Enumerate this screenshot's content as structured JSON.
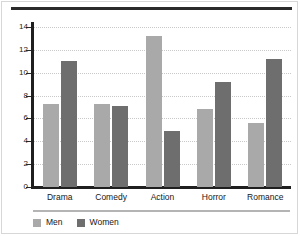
{
  "chart_data": {
    "type": "bar",
    "title": "",
    "subtitle": "",
    "xlabel": "",
    "ylabel": "",
    "categories": [
      "Drama",
      "Comedy",
      "Action",
      "Horror",
      "Romance"
    ],
    "series": [
      {
        "name": "Men",
        "color": "#a9a9a9",
        "values": [
          7.3,
          7.3,
          13.2,
          6.8,
          5.6
        ]
      },
      {
        "name": "Women",
        "color": "#6e6e6e",
        "values": [
          11.0,
          7.1,
          4.9,
          9.2,
          11.2
        ]
      }
    ],
    "ylim": [
      0,
      14.5
    ],
    "yticks": [
      0,
      2,
      4,
      6,
      8,
      10,
      12,
      14
    ],
    "ytick_labels": [
      "0",
      "2",
      "4",
      "6",
      "8",
      "10",
      "12",
      "14"
    ],
    "grid": true,
    "grid_axis": "y",
    "legend_position": "bottom-left",
    "orientation": "vertical",
    "grouping": "grouped"
  },
  "legend": {
    "items": [
      {
        "label": "Men",
        "color": "#a9a9a9"
      },
      {
        "label": "Women",
        "color": "#6e6e6e"
      }
    ]
  },
  "style": {
    "background": "#ffffff",
    "axis_color": "#1f1f1f",
    "grid_color": "#c9c9c9",
    "text_color": "#161616",
    "top_rule_color": "#2a2a2a",
    "legend_rule_color": "#b4b4b4"
  }
}
